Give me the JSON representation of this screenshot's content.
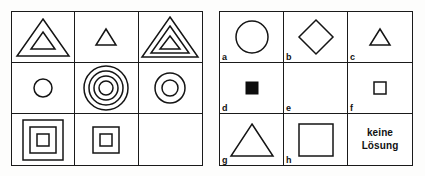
{
  "document": {
    "title": "Matrizen-Test Aufgabe",
    "language": "de",
    "ink_color": "#141414",
    "paper_color": "#ffffff"
  },
  "problem_matrix": {
    "name": "problem-matrix",
    "rows": 3,
    "columns": 3,
    "cells": [
      {
        "id": "cell-1",
        "row": 1,
        "col": 1,
        "shape": "triangle",
        "count": 2,
        "size": "large",
        "fill": "outline",
        "description": "two nested triangles"
      },
      {
        "id": "cell-2",
        "row": 1,
        "col": 2,
        "shape": "triangle",
        "count": 1,
        "size": "small",
        "fill": "outline",
        "description": "one small triangle"
      },
      {
        "id": "cell-3",
        "row": 1,
        "col": 3,
        "shape": "triangle",
        "count": 3,
        "size": "large",
        "fill": "outline",
        "description": "three nested triangles"
      },
      {
        "id": "cell-4",
        "row": 2,
        "col": 1,
        "shape": "circle",
        "count": 1,
        "size": "small",
        "fill": "outline",
        "description": "one small circle"
      },
      {
        "id": "cell-5",
        "row": 2,
        "col": 2,
        "shape": "circle",
        "count": 4,
        "size": "large",
        "fill": "outline",
        "description": "four concentric circles"
      },
      {
        "id": "cell-6",
        "row": 2,
        "col": 3,
        "shape": "circle",
        "count": 2,
        "size": "medium",
        "fill": "outline",
        "description": "two concentric circles"
      },
      {
        "id": "cell-7",
        "row": 3,
        "col": 1,
        "shape": "square",
        "count": 3,
        "size": "large",
        "fill": "outline",
        "description": "three nested squares"
      },
      {
        "id": "cell-8",
        "row": 3,
        "col": 2,
        "shape": "square",
        "count": 2,
        "size": "small",
        "fill": "outline",
        "description": "two nested squares"
      },
      {
        "id": "cell-9",
        "row": 3,
        "col": 3,
        "shape": "none",
        "count": 0,
        "size": "",
        "fill": "",
        "description": "empty cell to be solved"
      }
    ]
  },
  "answer_panel": {
    "name": "answer-options",
    "rows": 3,
    "columns": 3,
    "options": [
      {
        "label": "a",
        "shape": "circle",
        "count": 1,
        "size": "large",
        "fill": "outline",
        "description": "large circle outline"
      },
      {
        "label": "b",
        "shape": "diamond",
        "count": 1,
        "size": "large",
        "fill": "outline",
        "description": "large diamond outline"
      },
      {
        "label": "c",
        "shape": "triangle",
        "count": 1,
        "size": "small",
        "fill": "outline",
        "description": "small triangle outline"
      },
      {
        "label": "d",
        "shape": "square",
        "count": 1,
        "size": "small",
        "fill": "solid",
        "description": "small filled black square"
      },
      {
        "label": "e",
        "shape": "none",
        "count": 0,
        "size": "",
        "fill": "",
        "description": "blank option"
      },
      {
        "label": "f",
        "shape": "square",
        "count": 1,
        "size": "small",
        "fill": "outline",
        "description": "small square outline"
      },
      {
        "label": "g",
        "shape": "triangle",
        "count": 1,
        "size": "large",
        "fill": "outline",
        "description": "large triangle outline"
      },
      {
        "label": "h",
        "shape": "square",
        "count": 1,
        "size": "large",
        "fill": "outline",
        "description": "large square outline"
      },
      {
        "label": "",
        "shape": "text",
        "count": 0,
        "size": "",
        "fill": "",
        "description": "no solution text option"
      }
    ],
    "no_solution": {
      "line1": "keine",
      "line2": "Lösung"
    }
  }
}
